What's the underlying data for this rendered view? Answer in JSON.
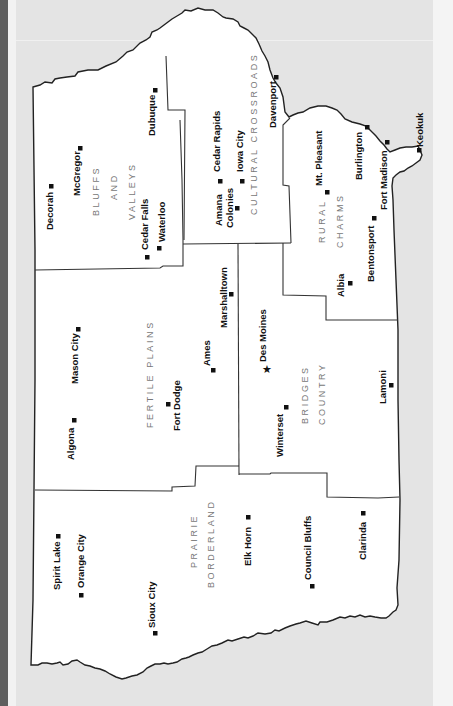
{
  "map": {
    "title": "Iowa Regions Map",
    "orientation": "rotated 90 degrees clockwise (north at left)",
    "colors": {
      "land": "#ffffff",
      "outside": "#e4e4e4",
      "border": "#222222",
      "region_label": "#777777",
      "city_label": "#111111"
    },
    "regions": [
      {
        "id": "bluffs",
        "lines": [
          "BLUFFS",
          "AND",
          "VALLEYS"
        ]
      },
      {
        "id": "cultural",
        "lines": [
          "CULTURAL CROSSROADS"
        ]
      },
      {
        "id": "rural",
        "lines": [
          "RURAL",
          "CHARMS"
        ]
      },
      {
        "id": "fertile",
        "lines": [
          "FERTILE PLAINS"
        ]
      },
      {
        "id": "bridges",
        "lines": [
          "BRIDGES",
          "COUNTRY"
        ]
      },
      {
        "id": "prairie",
        "lines": [
          "PRAIRIE",
          "BORDERLAND"
        ]
      }
    ],
    "cities": [
      {
        "name": "Decorah",
        "marker": "square",
        "region": "Bluffs and Valleys"
      },
      {
        "name": "McGregor",
        "marker": "square",
        "region": "Bluffs and Valleys"
      },
      {
        "name": "Dubuque",
        "marker": "square",
        "region": "Bluffs and Valleys"
      },
      {
        "name": "Cedar Falls",
        "marker": "square",
        "region": "Bluffs and Valleys"
      },
      {
        "name": "Waterloo",
        "marker": "square",
        "region": "Bluffs and Valleys"
      },
      {
        "name": "Cedar Rapids",
        "marker": "square",
        "region": "Cultural Crossroads"
      },
      {
        "name": "Iowa City",
        "marker": "square",
        "region": "Cultural Crossroads"
      },
      {
        "name": "Amana Colonies",
        "marker": "square",
        "region": "Cultural Crossroads"
      },
      {
        "name": "Davenport",
        "marker": "square",
        "region": "Cultural Crossroads"
      },
      {
        "name": "Mt. Pleasant",
        "marker": "square",
        "region": "Rural Charms"
      },
      {
        "name": "Burlington",
        "marker": "square",
        "region": "Rural Charms"
      },
      {
        "name": "Fort Madison",
        "marker": "square",
        "region": "Rural Charms"
      },
      {
        "name": "Keokuk",
        "marker": "square",
        "region": "Rural Charms"
      },
      {
        "name": "Bentonsport",
        "marker": "square",
        "region": "Rural Charms"
      },
      {
        "name": "Albia",
        "marker": "square",
        "region": "Rural Charms"
      },
      {
        "name": "Algona",
        "marker": "square",
        "region": "Fertile Plains"
      },
      {
        "name": "Mason City",
        "marker": "square",
        "region": "Fertile Plains"
      },
      {
        "name": "Fort Dodge",
        "marker": "square",
        "region": "Fertile Plains"
      },
      {
        "name": "Ames",
        "marker": "square",
        "region": "Fertile Plains"
      },
      {
        "name": "Marshalltown",
        "marker": "square",
        "region": "Fertile Plains"
      },
      {
        "name": "Des Moines",
        "marker": "star",
        "region": "Bridges Country"
      },
      {
        "name": "Winterset",
        "marker": "square",
        "region": "Bridges Country"
      },
      {
        "name": "Lamoni",
        "marker": "square",
        "region": "Bridges Country"
      },
      {
        "name": "Spirit Lake",
        "marker": "square",
        "region": "Prairie Borderland"
      },
      {
        "name": "Orange City",
        "marker": "square",
        "region": "Prairie Borderland"
      },
      {
        "name": "Sioux City",
        "marker": "square",
        "region": "Prairie Borderland"
      },
      {
        "name": "Elk Horn",
        "marker": "square",
        "region": "Prairie Borderland"
      },
      {
        "name": "Council Bluffs",
        "marker": "square",
        "region": "Prairie Borderland"
      },
      {
        "name": "Clarinda",
        "marker": "square",
        "region": "Prairie Borderland"
      }
    ]
  }
}
